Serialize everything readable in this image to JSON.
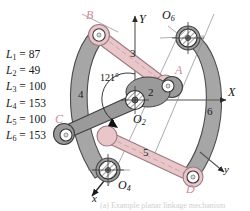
{
  "figure": {
    "background_color": "#ffffff",
    "caption": "(a) Example planar linkage mechanism"
  },
  "dimensions": {
    "heading": "link lengths",
    "items": [
      {
        "name": "L",
        "index": "1",
        "eq": "=",
        "value": "87",
        "text": "L1 = 87"
      },
      {
        "name": "L",
        "index": "2",
        "eq": "=",
        "value": "49",
        "text": "L2 = 49"
      },
      {
        "name": "L",
        "index": "3",
        "eq": "=",
        "value": "100",
        "text": "L3 = 100"
      },
      {
        "name": "L",
        "index": "4",
        "eq": "=",
        "value": "153",
        "text": "L4 = 153"
      },
      {
        "name": "L",
        "index": "5",
        "eq": "=",
        "value": "100",
        "text": "L5 = 100"
      },
      {
        "name": "L",
        "index": "6",
        "eq": "=",
        "value": "153",
        "text": "L6 = 153"
      }
    ]
  },
  "axes": {
    "global_x": "X",
    "global_y": "Y",
    "local_x": "x",
    "local_y": "y"
  },
  "angle_annotation": {
    "value": "121",
    "unit": "°",
    "text": "121°"
  },
  "joints": [
    {
      "id": "B",
      "label": "B",
      "type": "pin",
      "color": "#d08a9a"
    },
    {
      "id": "A",
      "label": "A",
      "type": "pin",
      "color": "#d08a9a"
    },
    {
      "id": "C",
      "label": "C",
      "type": "pin",
      "color": "#d08a9a"
    },
    {
      "id": "D",
      "label": "D",
      "type": "pin",
      "color": "#d08a9a"
    },
    {
      "id": "O2",
      "label": "O",
      "sub": "2",
      "type": "ground-pivot",
      "text": "O2"
    },
    {
      "id": "O4",
      "label": "O",
      "sub": "4",
      "type": "ground-pivot",
      "text": "O4"
    },
    {
      "id": "O6",
      "label": "O",
      "sub": "6",
      "type": "ground-pivot",
      "text": "O6"
    }
  ],
  "links": [
    {
      "number": "2",
      "label": "2",
      "color": "#9a9a9a",
      "kind": "ternary-crank"
    },
    {
      "number": "3",
      "label": "3",
      "color": "#e8c6c9",
      "kind": "coupler"
    },
    {
      "number": "4",
      "label": "4",
      "color": "#a6a6a6",
      "kind": "arc-rocker"
    },
    {
      "number": "5",
      "label": "5",
      "color": "#e8c6c9",
      "kind": "coupler"
    },
    {
      "number": "6",
      "label": "6",
      "color": "#a6a6a6",
      "kind": "arc-rocker"
    }
  ],
  "colors": {
    "pink_link": "#e8c6c9",
    "pink_link_stroke": "#b08a90",
    "gray_link": "#a6a6a6",
    "gray_link_stroke": "#5a5a5a",
    "outline": "#3a3a3a",
    "pink_text": "#d08a9a",
    "axis": "#444444"
  }
}
